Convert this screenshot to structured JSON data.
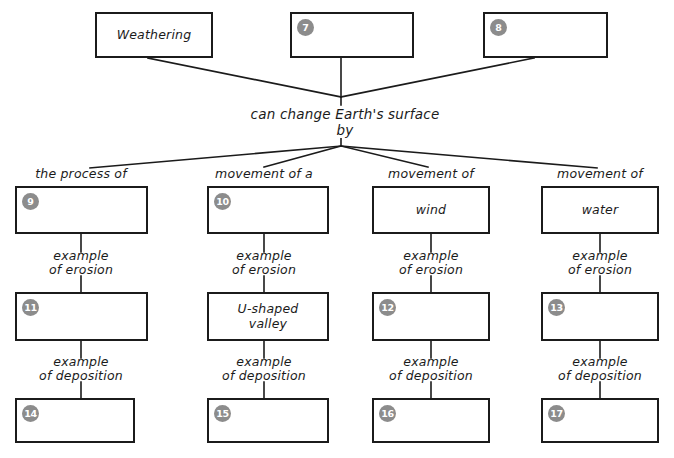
{
  "diagram": {
    "hub_text": "can change Earth's surface by",
    "colors": {
      "stroke": "#1b1b1b",
      "badge_fill": "#8c8c8c",
      "badge_text": "#ffffff",
      "background": "#ffffff"
    },
    "top_row": [
      {
        "badge": "",
        "text": "Weathering"
      },
      {
        "badge": "7",
        "text": ""
      },
      {
        "badge": "8",
        "text": ""
      }
    ],
    "columns": [
      {
        "header": "the process of",
        "top_box": {
          "badge": "9",
          "text": ""
        },
        "link_1": "example\nof erosion",
        "mid_box": {
          "badge": "11",
          "text": ""
        },
        "link_2": "example\nof deposition",
        "bottom_box": {
          "badge": "14",
          "text": ""
        }
      },
      {
        "header": "movement of a",
        "top_box": {
          "badge": "10",
          "text": ""
        },
        "link_1": "example\nof erosion",
        "mid_box": {
          "badge": "",
          "text": "U-shaped\nvalley"
        },
        "link_2": "example\nof deposition",
        "bottom_box": {
          "badge": "15",
          "text": ""
        }
      },
      {
        "header": "movement of",
        "top_box": {
          "badge": "",
          "text": "wind"
        },
        "link_1": "example\nof erosion",
        "mid_box": {
          "badge": "12",
          "text": ""
        },
        "link_2": "example\nof deposition",
        "bottom_box": {
          "badge": "16",
          "text": ""
        }
      },
      {
        "header": "movement of",
        "top_box": {
          "badge": "",
          "text": "water"
        },
        "link_1": "example\nof erosion",
        "mid_box": {
          "badge": "13",
          "text": ""
        },
        "link_2": "example\nof deposition",
        "bottom_box": {
          "badge": "17",
          "text": ""
        }
      }
    ]
  }
}
